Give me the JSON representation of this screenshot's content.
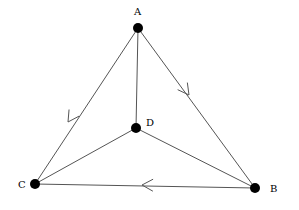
{
  "diagram": {
    "type": "directed-graph",
    "nodes": [
      {
        "id": "A",
        "label": "A",
        "x": 138,
        "y": 28,
        "label_x": 134,
        "label_y": 15
      },
      {
        "id": "B",
        "label": "B",
        "x": 255,
        "y": 188,
        "label_x": 270,
        "label_y": 192
      },
      {
        "id": "C",
        "label": "C",
        "x": 35,
        "y": 184,
        "label_x": 18,
        "label_y": 188
      },
      {
        "id": "D",
        "label": "D",
        "x": 136,
        "y": 128,
        "label_x": 146,
        "label_y": 126
      }
    ],
    "edges": [
      {
        "from": "A",
        "to": "C",
        "directed": true,
        "arrow_at": [
          68,
          122
        ]
      },
      {
        "from": "A",
        "to": "B",
        "directed": true,
        "arrow_at": [
          189,
          95
        ]
      },
      {
        "from": "B",
        "to": "C",
        "directed": true,
        "arrow_at": [
          142,
          185
        ]
      },
      {
        "from": "A",
        "to": "D",
        "directed": false
      },
      {
        "from": "D",
        "to": "C",
        "directed": false
      },
      {
        "from": "D",
        "to": "B",
        "directed": false
      }
    ],
    "colors": {
      "edge": "#555555",
      "node": "#000000",
      "background": "#ffffff"
    }
  }
}
